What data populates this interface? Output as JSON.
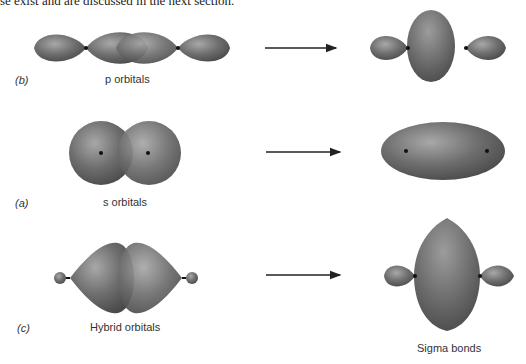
{
  "header": {
    "cut_text": "se exist and are discussed in the next section."
  },
  "rows": [
    {
      "panel": "(b)",
      "left_label": "p orbitals",
      "right_label": ""
    },
    {
      "panel": "(a)",
      "left_label": "s orbitals",
      "right_label": ""
    },
    {
      "panel": "(c)",
      "left_label": "Hybrid orbitals",
      "right_label": "Sigma bonds"
    }
  ],
  "colors": {
    "orbital": "#6b6b6b",
    "orbital_dark": "#4a4a4a",
    "orbital_light": "#9a9a9a",
    "arrow": "#222222",
    "nucleus": "#111111"
  }
}
